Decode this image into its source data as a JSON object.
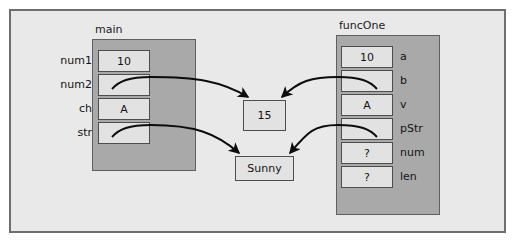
{
  "diagram": {
    "title_main": "main",
    "title_func": "funcOne",
    "colors": {
      "canvas": "#e9e9e9",
      "frame_fill": "#a9a9a9",
      "cell_fill": "#e2e2e2",
      "border": "#4d4d4d",
      "outer_border": "#6e6e6e"
    },
    "main_block": {
      "label": "main",
      "rows": [
        {
          "name": "num1",
          "value": "10",
          "pointer": false
        },
        {
          "name": "num2",
          "value": "",
          "pointer": true
        },
        {
          "name": "ch",
          "value": "A",
          "pointer": false
        },
        {
          "name": "str",
          "value": "",
          "pointer": true
        }
      ]
    },
    "func_block": {
      "label": "funcOne",
      "rows": [
        {
          "name": "a",
          "value": "10",
          "pointer": false
        },
        {
          "name": "b",
          "value": "",
          "pointer": true
        },
        {
          "name": "v",
          "value": "A",
          "pointer": false
        },
        {
          "name": "pStr",
          "value": "",
          "pointer": true
        },
        {
          "name": "num",
          "value": "?",
          "pointer": false
        },
        {
          "name": "len",
          "value": "?",
          "pointer": false
        }
      ]
    },
    "heap": [
      {
        "id": "int-cell",
        "value": "15"
      },
      {
        "id": "string-cell",
        "value": "Sunny"
      }
    ],
    "arrows": [
      {
        "from": "main.num2",
        "to": "int-cell"
      },
      {
        "from": "funcOne.b",
        "to": "int-cell"
      },
      {
        "from": "main.str",
        "to": "string-cell"
      },
      {
        "from": "funcOne.pStr",
        "to": "string-cell"
      }
    ]
  }
}
